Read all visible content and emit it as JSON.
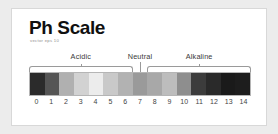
{
  "card": {
    "title": "Ph Scale",
    "subtitle": "vector eps 10",
    "background_color": "#ffffff",
    "border_color": "#d8d8d8",
    "page_background": "#ececec"
  },
  "zones": [
    {
      "label": "Acidic",
      "start_index": 0,
      "end_index": 6,
      "type": "bracket"
    },
    {
      "label": "Neutral",
      "start_index": 7,
      "end_index": 7,
      "type": "tick"
    },
    {
      "label": "Alkaline",
      "start_index": 8,
      "end_index": 14,
      "type": "bracket"
    }
  ],
  "chart_data": {
    "type": "bar",
    "title": "Ph Scale",
    "xlabel": "",
    "ylabel": "",
    "categories": [
      "0",
      "1",
      "2",
      "3",
      "4",
      "5",
      "6",
      "7",
      "8",
      "9",
      "10",
      "11",
      "12",
      "13",
      "14"
    ],
    "values": [
      1,
      1,
      1,
      1,
      1,
      1,
      1,
      1,
      1,
      1,
      1,
      1,
      1,
      1,
      1
    ],
    "colors": [
      "#2b2b2b",
      "#555555",
      "#b0b0b0",
      "#d2d2d2",
      "#ececec",
      "#c9c9c9",
      "#b2b2b2",
      "#9a9a9a",
      "#a8a8a8",
      "#bdbdbd",
      "#8e8e8e",
      "#3c3c3c",
      "#2a2a2a",
      "#1a1a1a",
      "#1d1d1d"
    ],
    "tick_labels": [
      "0",
      "1",
      "2",
      "3",
      "4",
      "5",
      "6",
      "7",
      "8",
      "9",
      "10",
      "11",
      "12",
      "13",
      "14"
    ],
    "annotations": [
      "Acidic",
      "Neutral",
      "Alkaline"
    ],
    "grid": false,
    "legend": "none"
  }
}
